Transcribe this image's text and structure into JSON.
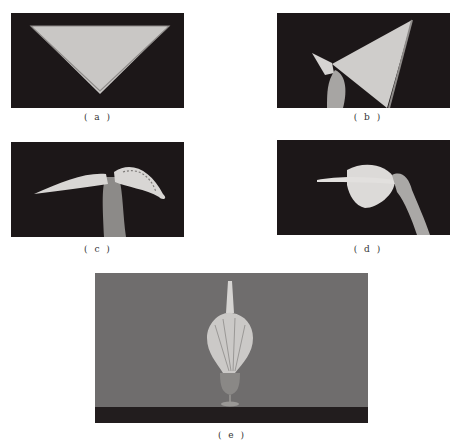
{
  "figure": {
    "panels": [
      {
        "id": "a",
        "caption": "( a )",
        "description": "square napkin folded into a triangle on dark background"
      },
      {
        "id": "b",
        "caption": "( b )",
        "description": "hand rolling the triangle from one corner"
      },
      {
        "id": "c",
        "caption": "( c )",
        "description": "pleated napkin fanned out on both sides of hand"
      },
      {
        "id": "d",
        "caption": "( d )",
        "description": "hand holding pleated fan shape"
      },
      {
        "id": "e",
        "caption": "( e )",
        "description": "finished fan-shaped napkin standing in a goblet"
      }
    ],
    "colors": {
      "dark_bg": "#1c1718",
      "grey_bg": "#6f6d6d",
      "napkin": "#cfcdcb",
      "table": "#221d1e"
    }
  }
}
